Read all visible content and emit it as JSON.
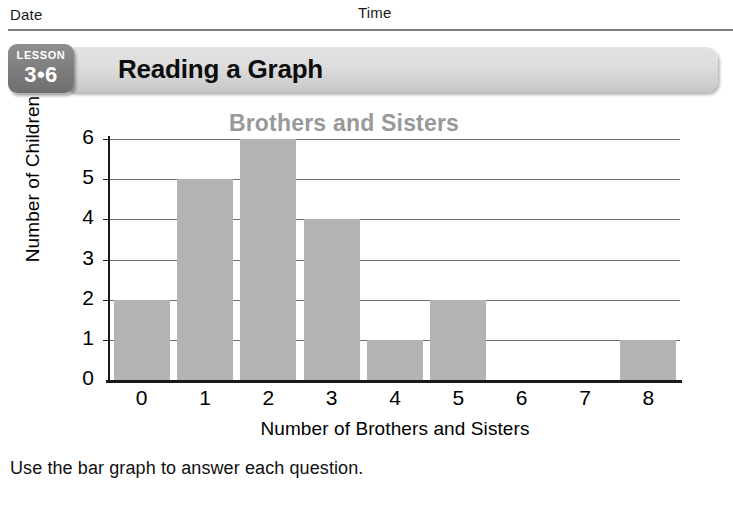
{
  "worksheet": {
    "date_label": "Date",
    "time_label": "Time",
    "lesson_word": "LESSON",
    "lesson_number": "3•6",
    "banner_title": "Reading a Graph",
    "instruction": "Use the bar graph to answer each question."
  },
  "colors": {
    "bar_fill": "#b3b3b3",
    "title_gray": "#999999",
    "banner_gray": "#dcdcdc",
    "badge_gray": "#7e7e7e",
    "rule_gray": "#808080",
    "axis_black": "#1a1a1a",
    "gridline_gray": "#6e6e6e"
  },
  "chart_data": {
    "type": "bar",
    "title": "Brothers and Sisters",
    "xlabel": "Number of Brothers and Sisters",
    "ylabel": "Number of Children",
    "categories": [
      "0",
      "1",
      "2",
      "3",
      "4",
      "5",
      "6",
      "7",
      "8"
    ],
    "values": [
      2,
      5,
      6,
      4,
      1,
      2,
      0,
      0,
      1
    ],
    "ylim": [
      0,
      6
    ],
    "yticks": [
      "0",
      "1",
      "2",
      "3",
      "4",
      "5",
      "6"
    ],
    "grid": true,
    "legend": null
  }
}
